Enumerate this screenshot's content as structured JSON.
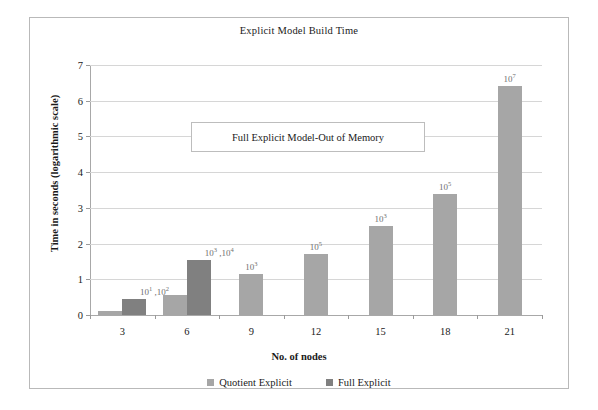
{
  "chart_data": {
    "type": "bar",
    "title": "Explicit Model Build Time",
    "xlabel": "No. of nodes",
    "ylabel": "Time in seconds (logarithmic scale)",
    "categories": [
      "3",
      "6",
      "9",
      "12",
      "15",
      "18",
      "21"
    ],
    "ylim": [
      0,
      7
    ],
    "yticks": [
      "0",
      "1",
      "2",
      "3",
      "4",
      "5",
      "6",
      "7"
    ],
    "grid": true,
    "legend_position": "bottom",
    "series": [
      {
        "name": "Quotient Explicit",
        "color": "#a6a6a6",
        "values": [
          0.1,
          0.55,
          1.15,
          1.7,
          2.5,
          3.4,
          6.4
        ],
        "point_labels": [
          "10",
          "10",
          "10",
          "10",
          "10",
          "10",
          "10"
        ],
        "point_exponents": [
          "1",
          "3",
          "3",
          "5",
          "3",
          "5",
          "7"
        ]
      },
      {
        "name": "Full Explicit",
        "color": "#808080",
        "values": [
          0.45,
          1.55,
          null,
          null,
          null,
          null,
          null
        ],
        "point_labels": [
          "10",
          "10",
          null,
          null,
          null,
          null,
          null
        ],
        "point_exponents": [
          "2",
          "4",
          null,
          null,
          null,
          null,
          null
        ]
      }
    ],
    "annotations": [
      {
        "text": "Full Explicit Model-Out of Memory"
      }
    ]
  },
  "legend": {
    "items": [
      {
        "label": "Quotient Explicit"
      },
      {
        "label": "Full Explicit"
      }
    ]
  }
}
